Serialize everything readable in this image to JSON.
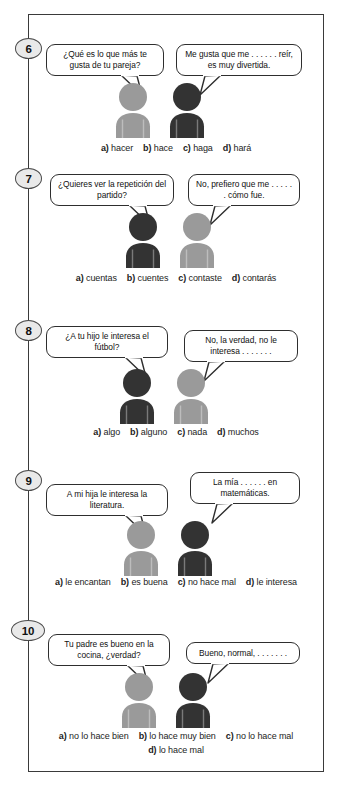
{
  "page": {
    "kind": "spanish-grammar-multiple-choice-worksheet",
    "palette": {
      "frame_border": "#3a3a3a",
      "bubble_border": "#2e2e2e",
      "figure_light": "#9a9a9a",
      "figure_dark": "#333333",
      "badge_fill": "#e9e9e9",
      "text": "#1a1a1a",
      "background": "#ffffff"
    }
  },
  "exercises": [
    {
      "number": "6",
      "left_bubble": "¿Qué es lo que más te gusta de tu pareja?",
      "right_bubble": "Me gusta que me . . . . . . reír, es muy divertida.",
      "left_figure_tone": "light",
      "right_figure_tone": "dark",
      "options": [
        {
          "letter": "a)",
          "text": "hacer"
        },
        {
          "letter": "b)",
          "text": "hace"
        },
        {
          "letter": "c)",
          "text": "haga"
        },
        {
          "letter": "d)",
          "text": "hará"
        }
      ]
    },
    {
      "number": "7",
      "left_bubble": "¿Quieres ver la repetición del partido?",
      "right_bubble": "No, prefiero que me . . . . . . cómo fue.",
      "left_figure_tone": "dark",
      "right_figure_tone": "light",
      "options": [
        {
          "letter": "a)",
          "text": "cuentas"
        },
        {
          "letter": "b)",
          "text": "cuentes"
        },
        {
          "letter": "c)",
          "text": "contaste"
        },
        {
          "letter": "d)",
          "text": "contarás"
        }
      ]
    },
    {
      "number": "8",
      "left_bubble": "¿A tu hijo le interesa el fútbol?",
      "right_bubble": "No, la verdad, no le interesa . . . . . . .",
      "left_figure_tone": "dark",
      "right_figure_tone": "light",
      "options": [
        {
          "letter": "a)",
          "text": "algo"
        },
        {
          "letter": "b)",
          "text": "alguno"
        },
        {
          "letter": "c)",
          "text": "nada"
        },
        {
          "letter": "d)",
          "text": "muchos"
        }
      ]
    },
    {
      "number": "9",
      "left_bubble": "A mi hija le interesa la literatura.",
      "right_bubble": "La mía . . . . . . en matemáticas.",
      "left_figure_tone": "light",
      "right_figure_tone": "dark",
      "options": [
        {
          "letter": "a)",
          "text": "le encantan"
        },
        {
          "letter": "b)",
          "text": "es buena"
        },
        {
          "letter": "c)",
          "text": "no hace mal"
        },
        {
          "letter": "d)",
          "text": "le interesa"
        }
      ]
    },
    {
      "number": "10",
      "left_bubble": "Tu padre es bueno en la cocina, ¿verdad?",
      "right_bubble": "Bueno, normal, . . . . . . .",
      "left_figure_tone": "light",
      "right_figure_tone": "dark",
      "options": [
        {
          "letter": "a)",
          "text": "no lo hace bien"
        },
        {
          "letter": "b)",
          "text": "lo hace muy bien"
        },
        {
          "letter": "c)",
          "text": "no lo hace mal"
        },
        {
          "letter": "d)",
          "text": "lo hace mal"
        }
      ]
    }
  ]
}
